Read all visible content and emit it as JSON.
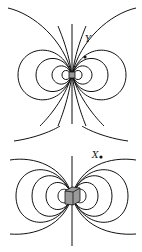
{
  "diagrams": [
    {
      "id": "top",
      "description": "dipole field lines around small cube",
      "point_label": "Y",
      "center": [
        72,
        75
      ],
      "cube_size": 6
    },
    {
      "id": "bottom",
      "description": "dipole field lines around larger cube",
      "point_label": "X",
      "center": [
        72,
        196
      ],
      "cube_size": 14
    }
  ],
  "colors": {
    "line": "#111111",
    "cube_fill": "#9a9a9a",
    "background": "#ffffff"
  }
}
